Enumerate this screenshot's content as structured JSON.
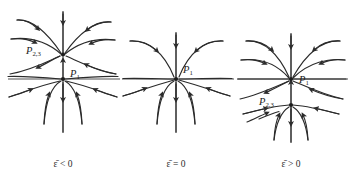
{
  "figure": {
    "type": "phase-portrait-diagram",
    "background_color": "#ffffff",
    "stroke_color": "#2b2b2b",
    "axis_color": "#6e6e6e",
    "panel_count": 3
  },
  "panels": [
    {
      "id": "panel-epsilon-negative",
      "caption": "ε̄ < 0",
      "caption_parts": {
        "symbol": "ε",
        "overbar": true,
        "relation": "<",
        "value": "0"
      },
      "origin": {
        "x": 63,
        "y": 79
      },
      "fixed_points": [
        {
          "label": "P",
          "subscript": "1",
          "x": 63,
          "y": 79,
          "label_x": 70,
          "label_y": 76
        },
        {
          "label": "P",
          "subscript": "2,3",
          "x": 63,
          "y": 55,
          "label_x": 30,
          "label_y": 53
        }
      ],
      "axes": {
        "vertical": true,
        "horizontal": true
      }
    },
    {
      "id": "panel-epsilon-zero",
      "caption": "ε̄ = 0",
      "caption_parts": {
        "symbol": "ε",
        "overbar": true,
        "relation": "=",
        "value": "0"
      },
      "origin": {
        "x": 176,
        "y": 79
      },
      "fixed_points": [
        {
          "label": "P",
          "subscript": "1",
          "x": 176,
          "y": 79,
          "label_x": 183,
          "label_y": 72
        }
      ],
      "axes": {
        "vertical": true,
        "horizontal": true
      }
    },
    {
      "id": "panel-epsilon-positive",
      "caption": "ε̄ > 0",
      "caption_parts": {
        "symbol": "ε",
        "overbar": true,
        "relation": ">",
        "value": "0"
      },
      "origin": {
        "x": 291,
        "y": 79
      },
      "fixed_points": [
        {
          "label": "P",
          "subscript": "1",
          "x": 291,
          "y": 79,
          "label_x": 299,
          "label_y": 83
        },
        {
          "label": "P",
          "subscript": "2,3",
          "x": 291,
          "y": 105,
          "label_x": 262,
          "label_y": 108
        }
      ],
      "axes": {
        "vertical": true,
        "horizontal": true
      }
    }
  ],
  "captions": {
    "panel_1": "ε̄ < 0",
    "panel_2": "ε̄ = 0",
    "panel_3": "ε̄ > 0"
  },
  "labels": {
    "p1": "P",
    "p1_sub": "1",
    "p23": "P",
    "p23_sub": "2,3"
  }
}
